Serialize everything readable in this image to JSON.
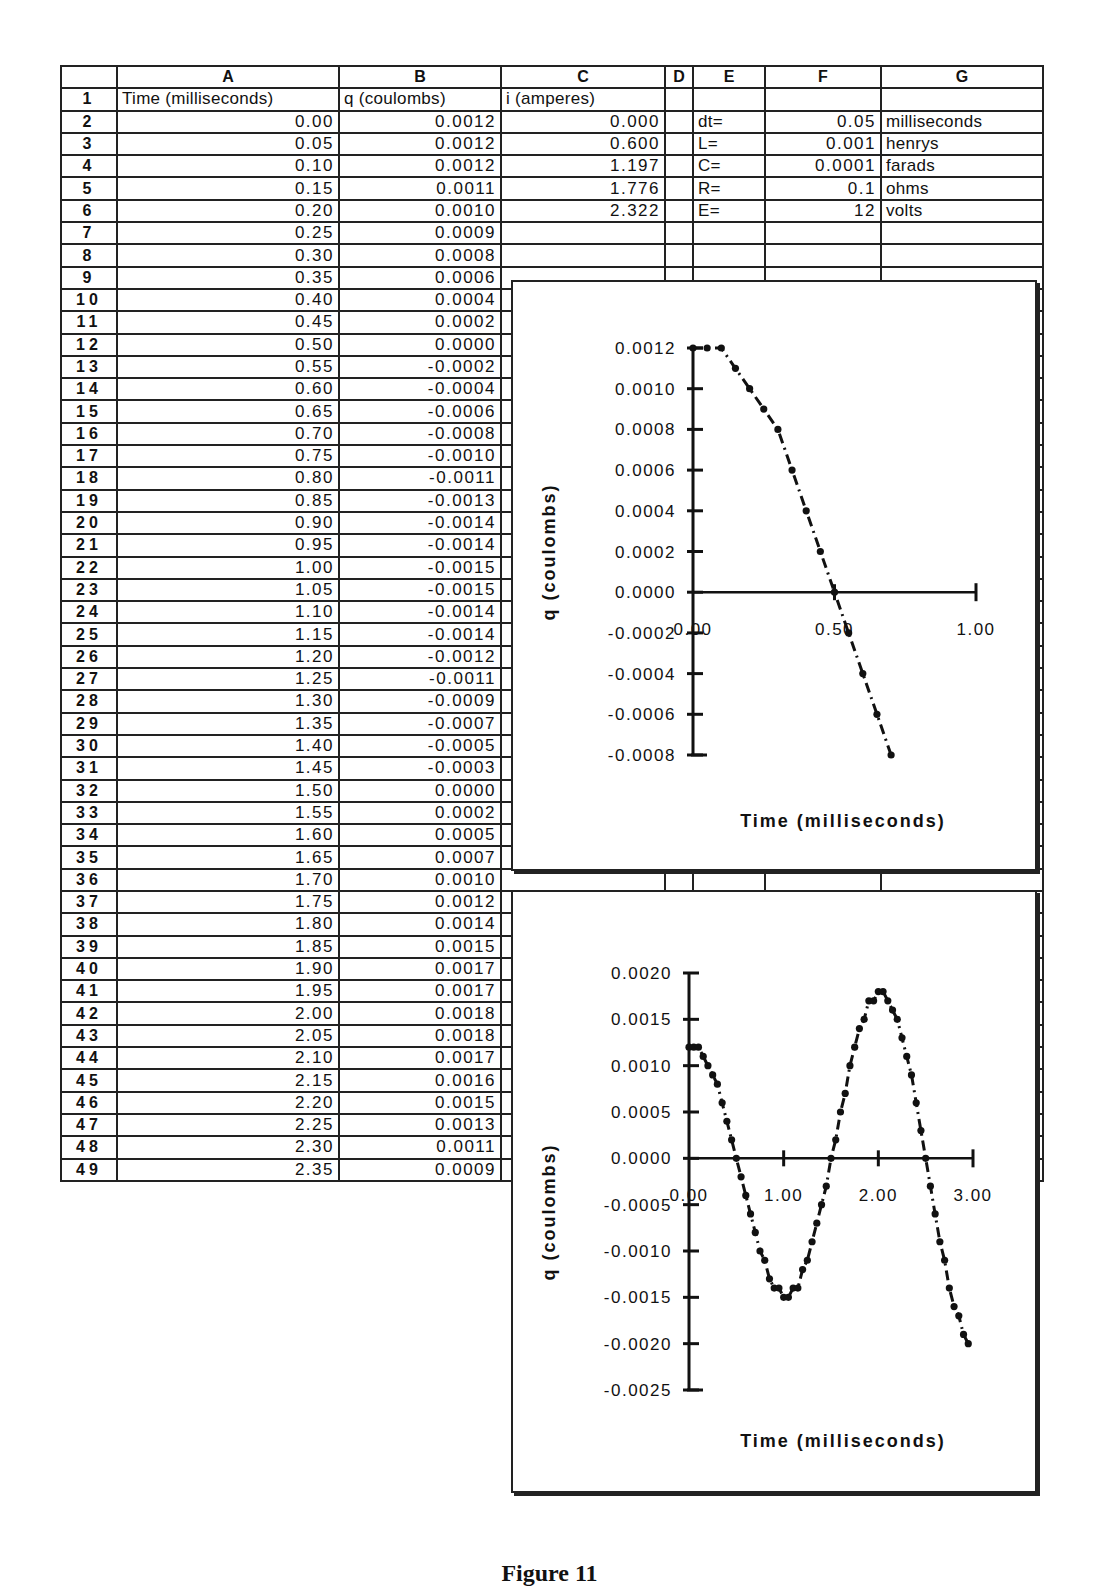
{
  "spreadsheet": {
    "column_headers": [
      "",
      "A",
      "B",
      "C",
      "D",
      "E",
      "F",
      "G"
    ],
    "header_row": {
      "row": "1",
      "A": "Time  (milliseconds)",
      "B": "q  (coulombs)",
      "C": "i  (amperes)"
    },
    "parameters": [
      {
        "row": "2",
        "label": "dt=",
        "value": "0.05",
        "unit": "milliseconds"
      },
      {
        "row": "3",
        "label": "L=",
        "value": "0.001",
        "unit": "henrys"
      },
      {
        "row": "4",
        "label": "C=",
        "value": "0.0001",
        "unit": "farads"
      },
      {
        "row": "5",
        "label": "R=",
        "value": "0.1",
        "unit": "ohms"
      },
      {
        "row": "6",
        "label": "E=",
        "value": "12",
        "unit": "volts"
      }
    ],
    "rows": [
      {
        "row": "2",
        "A": "0.00",
        "B": "0.0012",
        "C": "0.000"
      },
      {
        "row": "3",
        "A": "0.05",
        "B": "0.0012",
        "C": "0.600"
      },
      {
        "row": "4",
        "A": "0.10",
        "B": "0.0012",
        "C": "1.197"
      },
      {
        "row": "5",
        "A": "0.15",
        "B": "0.0011",
        "C": "1.776"
      },
      {
        "row": "6",
        "A": "0.20",
        "B": "0.0010",
        "C": "2.322"
      },
      {
        "row": "7",
        "A": "0.25",
        "B": "0.0009",
        "C": ""
      },
      {
        "row": "8",
        "A": "0.30",
        "B": "0.0008",
        "C": ""
      },
      {
        "row": "9",
        "A": "0.35",
        "B": "0.0006",
        "C": ""
      },
      {
        "row": "10",
        "A": "0.40",
        "B": "0.0004",
        "C": ""
      },
      {
        "row": "11",
        "A": "0.45",
        "B": "0.0002",
        "C": ""
      },
      {
        "row": "12",
        "A": "0.50",
        "B": "0.0000",
        "C": ""
      },
      {
        "row": "13",
        "A": "0.55",
        "B": "-0.0002",
        "C": ""
      },
      {
        "row": "14",
        "A": "0.60",
        "B": "-0.0004",
        "C": ""
      },
      {
        "row": "15",
        "A": "0.65",
        "B": "-0.0006",
        "C": ""
      },
      {
        "row": "16",
        "A": "0.70",
        "B": "-0.0008",
        "C": ""
      },
      {
        "row": "17",
        "A": "0.75",
        "B": "-0.0010",
        "C": ""
      },
      {
        "row": "18",
        "A": "0.80",
        "B": "-0.0011",
        "C": ""
      },
      {
        "row": "19",
        "A": "0.85",
        "B": "-0.0013",
        "C": ""
      },
      {
        "row": "20",
        "A": "0.90",
        "B": "-0.0014",
        "C": ""
      },
      {
        "row": "21",
        "A": "0.95",
        "B": "-0.0014",
        "C": ""
      },
      {
        "row": "22",
        "A": "1.00",
        "B": "-0.0015",
        "C": ""
      },
      {
        "row": "23",
        "A": "1.05",
        "B": "-0.0015",
        "C": ""
      },
      {
        "row": "24",
        "A": "1.10",
        "B": "-0.0014",
        "C": ""
      },
      {
        "row": "25",
        "A": "1.15",
        "B": "-0.0014",
        "C": ""
      },
      {
        "row": "26",
        "A": "1.20",
        "B": "-0.0012",
        "C": ""
      },
      {
        "row": "27",
        "A": "1.25",
        "B": "-0.0011",
        "C": ""
      },
      {
        "row": "28",
        "A": "1.30",
        "B": "-0.0009",
        "C": "-3.980"
      },
      {
        "row": "29",
        "A": "1.35",
        "B": "-0.0007",
        "C": ""
      },
      {
        "row": "30",
        "A": "1.40",
        "B": "-0.0005",
        "C": ""
      },
      {
        "row": "31",
        "A": "1.45",
        "B": "-0.0003",
        "C": ""
      },
      {
        "row": "32",
        "A": "1.50",
        "B": "0.0000",
        "C": ""
      },
      {
        "row": "33",
        "A": "1.55",
        "B": "0.0002",
        "C": ""
      },
      {
        "row": "34",
        "A": "1.60",
        "B": "0.0005",
        "C": ""
      },
      {
        "row": "35",
        "A": "1.65",
        "B": "0.0007",
        "C": ""
      },
      {
        "row": "36",
        "A": "1.70",
        "B": "0.0010",
        "C": ""
      },
      {
        "row": "37",
        "A": "1.75",
        "B": "0.0012",
        "C": ""
      },
      {
        "row": "38",
        "A": "1.80",
        "B": "0.0014",
        "C": ""
      },
      {
        "row": "39",
        "A": "1.85",
        "B": "0.0015",
        "C": ""
      },
      {
        "row": "40",
        "A": "1.90",
        "B": "0.0017",
        "C": ""
      },
      {
        "row": "41",
        "A": "1.95",
        "B": "0.0017",
        "C": ""
      },
      {
        "row": "42",
        "A": "2.00",
        "B": "0.0018",
        "C": ""
      },
      {
        "row": "43",
        "A": "2.05",
        "B": "0.0018",
        "C": ""
      },
      {
        "row": "44",
        "A": "2.10",
        "B": "0.0017",
        "C": ""
      },
      {
        "row": "45",
        "A": "2.15",
        "B": "0.0016",
        "C": ""
      },
      {
        "row": "46",
        "A": "2.20",
        "B": "0.0015",
        "C": ""
      },
      {
        "row": "47",
        "A": "2.25",
        "B": "0.0013",
        "C": ""
      },
      {
        "row": "48",
        "A": "2.30",
        "B": "0.0011",
        "C": ""
      },
      {
        "row": "49",
        "A": "2.35",
        "B": "0.0009",
        "C": ""
      }
    ]
  },
  "chart_data": [
    {
      "type": "line",
      "title": "",
      "xlabel": "Time    (milliseconds)",
      "ylabel": "q   (coulombs)",
      "xlim": [
        0,
        1.0
      ],
      "ylim": [
        -0.0008,
        0.0012
      ],
      "x_ticks": [
        "0.00",
        "0.50",
        "1.00"
      ],
      "y_ticks": [
        "0.0012",
        "0.0010",
        "0.0008",
        "0.0006",
        "0.0004",
        "0.0002",
        "0.0000",
        "-0.0002",
        "-0.0004",
        "-0.0006",
        "-0.0008"
      ],
      "grid": false,
      "line_style": "dash-dot with point markers",
      "x": [
        0.0,
        0.05,
        0.1,
        0.15,
        0.2,
        0.25,
        0.3,
        0.35,
        0.4,
        0.45,
        0.5,
        0.55,
        0.6,
        0.65,
        0.7
      ],
      "values": [
        0.0012,
        0.0012,
        0.0012,
        0.0011,
        0.001,
        0.0009,
        0.0008,
        0.0006,
        0.0004,
        0.0002,
        0.0,
        -0.0002,
        -0.0004,
        -0.0006,
        -0.0008
      ]
    },
    {
      "type": "line",
      "title": "",
      "xlabel": "Time    (milliseconds)",
      "ylabel": "q   (coulombs)",
      "xlim": [
        0,
        3.0
      ],
      "ylim": [
        -0.0025,
        0.002
      ],
      "x_ticks": [
        "0.00",
        "1.00",
        "2.00",
        "3.00"
      ],
      "y_ticks": [
        "0.0020",
        "0.0015",
        "0.0010",
        "0.0005",
        "0.0000",
        "-0.0005",
        "-0.0010",
        "-0.0015",
        "-0.0020",
        "-0.0025"
      ],
      "grid": false,
      "line_style": "dash-dot with point markers",
      "x": [
        0.0,
        0.05,
        0.1,
        0.15,
        0.2,
        0.25,
        0.3,
        0.35,
        0.4,
        0.45,
        0.5,
        0.55,
        0.6,
        0.65,
        0.7,
        0.75,
        0.8,
        0.85,
        0.9,
        0.95,
        1.0,
        1.05,
        1.1,
        1.15,
        1.2,
        1.25,
        1.3,
        1.35,
        1.4,
        1.45,
        1.5,
        1.55,
        1.6,
        1.65,
        1.7,
        1.75,
        1.8,
        1.85,
        1.9,
        1.95,
        2.0,
        2.05,
        2.1,
        2.15,
        2.2,
        2.25,
        2.3,
        2.35,
        2.4,
        2.45,
        2.5,
        2.55,
        2.6,
        2.65,
        2.7,
        2.75,
        2.8,
        2.85,
        2.9,
        2.95
      ],
      "values": [
        0.0012,
        0.0012,
        0.0012,
        0.0011,
        0.001,
        0.0009,
        0.0008,
        0.0006,
        0.0004,
        0.0002,
        0.0,
        -0.0002,
        -0.0004,
        -0.0006,
        -0.0008,
        -0.001,
        -0.0011,
        -0.0013,
        -0.0014,
        -0.0014,
        -0.0015,
        -0.0015,
        -0.0014,
        -0.0014,
        -0.0012,
        -0.0011,
        -0.0009,
        -0.0007,
        -0.0005,
        -0.0003,
        0.0,
        0.0002,
        0.0005,
        0.0007,
        0.001,
        0.0012,
        0.0014,
        0.0015,
        0.0017,
        0.0017,
        0.0018,
        0.0018,
        0.0017,
        0.0016,
        0.0015,
        0.0013,
        0.0011,
        0.0009,
        0.0006,
        0.0003,
        0.0,
        -0.0003,
        -0.0006,
        -0.0009,
        -0.0011,
        -0.0014,
        -0.0016,
        -0.0017,
        -0.0019,
        -0.002
      ]
    }
  ],
  "caption": "Figure 11"
}
